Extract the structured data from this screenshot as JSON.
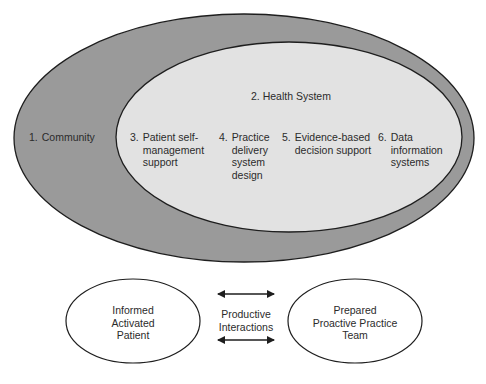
{
  "diagram": {
    "type": "nested-ellipses-chronic-care-model",
    "colors": {
      "background": "#ffffff",
      "outer_fill": "#9a9a9a",
      "inner_fill": "#e2e2e2",
      "stroke": "#1e1e1e",
      "text": "#2b2b2b"
    },
    "outer": {
      "number": "1.",
      "label": "Community"
    },
    "inner": {
      "title": "2. Health System",
      "components": [
        {
          "number": "3.",
          "lines": [
            "Patient self-",
            "management",
            "support"
          ]
        },
        {
          "number": "4.",
          "lines": [
            "Practice",
            "delivery",
            "system",
            "design"
          ]
        },
        {
          "number": "5.",
          "lines": [
            "Evidence-based",
            "decision support"
          ]
        },
        {
          "number": "6.",
          "lines": [
            "Data",
            "information",
            "systems"
          ]
        }
      ]
    },
    "bottom": {
      "left": {
        "lines": [
          "Informed",
          "Activated",
          "Patient"
        ]
      },
      "middle": {
        "lines": [
          "Productive",
          "Interactions"
        ]
      },
      "right": {
        "lines": [
          "Prepared",
          "Proactive Practice",
          "Team"
        ]
      }
    }
  }
}
